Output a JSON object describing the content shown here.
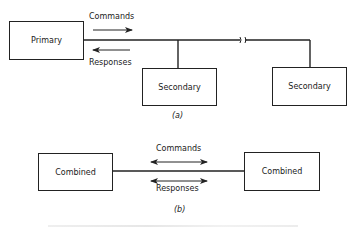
{
  "diagram_a": {
    "caption": "(a)",
    "primary": {
      "label": "Primary"
    },
    "secondaries": [
      {
        "label": "Secondary"
      },
      {
        "label": "Secondary"
      }
    ],
    "arrows": {
      "commands": {
        "label": "Commands",
        "direction": "right"
      },
      "responses": {
        "label": "Responses",
        "direction": "left"
      }
    },
    "line_break_symbol": "//"
  },
  "diagram_b": {
    "caption": "(b)",
    "stations": [
      {
        "label": "Combined"
      },
      {
        "label": "Combined"
      }
    ],
    "arrows": {
      "commands": {
        "label": "Commands",
        "direction": "both"
      },
      "responses": {
        "label": "Responses",
        "direction": "both"
      }
    }
  },
  "colors": {
    "ink": "#222222",
    "background": "#ffffff"
  }
}
